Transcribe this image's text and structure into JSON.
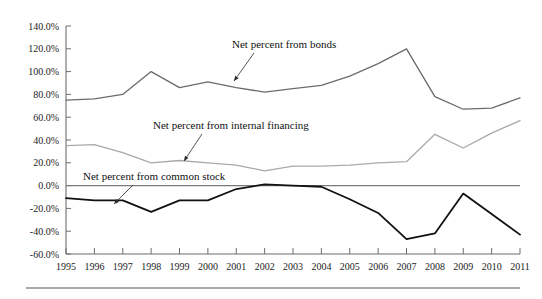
{
  "chart_data": {
    "type": "line",
    "title": "",
    "subtitle": "",
    "xlabel": "",
    "ylabel": "",
    "grid": false,
    "legend_position": "inline-annotations",
    "x": [
      1995,
      1996,
      1997,
      1998,
      1999,
      2000,
      2001,
      2002,
      2003,
      2004,
      2005,
      2006,
      2007,
      2008,
      2009,
      2010,
      2011
    ],
    "categories": [
      "1995",
      "1996",
      "1997",
      "1998",
      "1999",
      "2000",
      "2001",
      "2002",
      "2003",
      "2004",
      "2005",
      "2006",
      "2007",
      "2008",
      "2009",
      "2010",
      "2011"
    ],
    "xlim": [
      1995,
      2011
    ],
    "ylim": [
      -60,
      140
    ],
    "ytick_values": [
      140,
      120,
      100,
      80,
      60,
      40,
      20,
      0,
      -20,
      -40,
      -60
    ],
    "ytick_labels": [
      "140.0%",
      "120.0%",
      "100.0%",
      "80.0%",
      "60.0%",
      "40.0%",
      "20.0%",
      "0.0%",
      "-20.0%",
      "-40.0%",
      "-60.0%"
    ],
    "series": [
      {
        "name": "Net percent from bonds",
        "color": "#6b6b6b",
        "width": 1.3,
        "values": [
          75,
          76,
          80,
          100,
          86,
          91,
          86,
          82,
          85,
          88,
          96,
          107,
          120,
          78,
          67,
          68,
          77
        ]
      },
      {
        "name": "Net percent from internal financing",
        "color": "#a9a9a9",
        "width": 1.3,
        "values": [
          35,
          36,
          29,
          20,
          22,
          20,
          18,
          13,
          17,
          17,
          18,
          20,
          21,
          45,
          33,
          46,
          57
        ]
      },
      {
        "name": "Net percent from common stock",
        "color": "#111111",
        "width": 1.8,
        "values": [
          -11,
          -13,
          -13,
          -23,
          -13,
          -13,
          -3,
          1,
          0,
          -1,
          -12,
          -24,
          -47,
          -42,
          -7,
          -25,
          -43
        ]
      }
    ],
    "annotations": [
      {
        "text": "Net percent from bonds",
        "text_x": 232,
        "text_y": 48,
        "arrow_from_x": 254,
        "arrow_from_y": 53,
        "arrow_to_x": 234,
        "arrow_to_y": 81
      },
      {
        "text": "Net percent from internal financing",
        "text_x": 153,
        "text_y": 129,
        "arrow_from_x": 202,
        "arrow_from_y": 134,
        "arrow_to_x": 184,
        "arrow_to_y": 161
      },
      {
        "text": "Net percent from common stock",
        "text_x": 83,
        "text_y": 180,
        "arrow_from_x": 133,
        "arrow_from_y": 185,
        "arrow_to_x": 114,
        "arrow_to_y": 204
      }
    ]
  },
  "axes": {
    "y_axis_x": 66,
    "x_axis_y": 254,
    "plot_right": 520,
    "plot_top": 26,
    "zero_y": 192
  },
  "footer": {
    "rule_visible": "true"
  }
}
